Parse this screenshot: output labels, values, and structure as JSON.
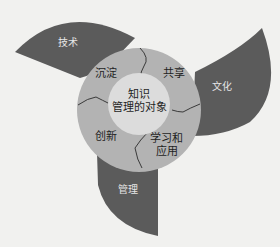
{
  "diagram": {
    "center": {
      "line1": "知识",
      "line2": "管理的对象"
    },
    "ring_segments": [
      {
        "label": "沉淀"
      },
      {
        "label": "共享"
      },
      {
        "label_line1": "学习和",
        "label_line2": "应用"
      },
      {
        "label": "创新"
      }
    ],
    "petals": [
      {
        "label": "技术"
      },
      {
        "label": "文化"
      },
      {
        "label": "管理"
      }
    ],
    "colors": {
      "background": "#f1f1ef",
      "petal": "#5b5b5b",
      "ring": "#b3b3b3",
      "center": "#dcdcdc",
      "divider": "#3a3a3a"
    }
  }
}
